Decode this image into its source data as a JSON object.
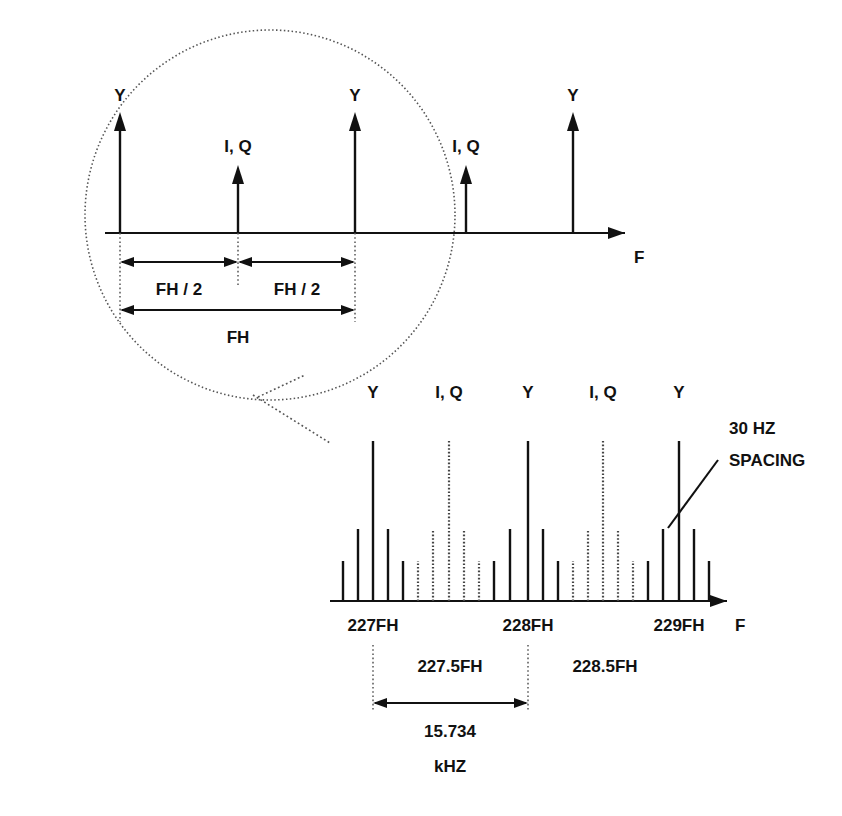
{
  "figure": {
    "axis_label": "F",
    "ink_color": "#111111",
    "dotted_color": "#555555"
  },
  "detail_view": {
    "name": "magnified-circle-view",
    "axis_label": "F",
    "spikes": [
      {
        "label": "Y",
        "x": 120,
        "height": 118,
        "style": "solid",
        "arrow": true
      },
      {
        "label": "I, Q",
        "x": 238,
        "height": 72,
        "style": "solid",
        "arrow": true
      },
      {
        "label": "Y",
        "x": 355,
        "height": 118,
        "style": "solid",
        "arrow": true
      },
      {
        "label": "I, Q",
        "x": 466,
        "height": 72,
        "style": "solid",
        "arrow": true
      },
      {
        "label": "Y",
        "x": 573,
        "height": 118,
        "style": "solid",
        "arrow": true
      }
    ],
    "dimensions": [
      {
        "label": "FH / 2",
        "from_x": 120,
        "to_x": 238,
        "y": 262
      },
      {
        "label": "FH / 2",
        "from_x": 238,
        "to_x": 355,
        "y": 262
      },
      {
        "label": "FH",
        "from_x": 120,
        "to_x": 355,
        "y": 310
      }
    ]
  },
  "spectrum_view": {
    "name": "sideband-spectrum",
    "axis_label": "F",
    "annotation": {
      "line1": "30 HZ",
      "line2": "SPACING"
    },
    "peak_labels": [
      {
        "text": "Y",
        "x": 373
      },
      {
        "text": "I, Q",
        "x": 449
      },
      {
        "text": "Y",
        "x": 528
      },
      {
        "text": "I, Q",
        "x": 603
      },
      {
        "text": "Y",
        "x": 679
      }
    ],
    "tick_labels": [
      {
        "text": "227FH",
        "x": 373
      },
      {
        "text": "228FH",
        "x": 528
      },
      {
        "text": "229FH",
        "x": 679
      }
    ],
    "band_labels": [
      {
        "text": "227.5FH",
        "x": 450
      },
      {
        "text": "228.5FH",
        "x": 605
      }
    ],
    "measurement": {
      "value": "15.734",
      "unit": "kHZ",
      "from_x": 373,
      "to_x": 528
    }
  },
  "chart_data": {
    "type": "bar",
    "xlabel": "F",
    "ylabel": "",
    "grid": false,
    "legend": [
      "Y (luminance, solid)",
      "I, Q (chrominance, dotted)"
    ],
    "note": "Harmonic clusters spaced at FH with 30 Hz sideband spacing; chroma interleaves at odd half-multiples of FH.",
    "annotations": [
      "30 HZ SPACING",
      "15.734 kHZ",
      "227.5FH",
      "228.5FH"
    ],
    "categories": [
      "227FH",
      "228FH",
      "229FH"
    ],
    "detail_categories": [
      "Y",
      "I, Q",
      "Y",
      "I, Q",
      "Y"
    ],
    "detail_values": [
      118,
      72,
      118,
      72,
      118
    ],
    "bars": [
      {
        "x": 343,
        "h": 40,
        "style": "solid"
      },
      {
        "x": 358,
        "h": 72,
        "style": "solid"
      },
      {
        "x": 373,
        "h": 160,
        "style": "solid"
      },
      {
        "x": 388,
        "h": 72,
        "style": "solid"
      },
      {
        "x": 403,
        "h": 40,
        "style": "solid"
      },
      {
        "x": 418,
        "h": 40,
        "style": "dotted"
      },
      {
        "x": 433,
        "h": 72,
        "style": "dotted"
      },
      {
        "x": 449,
        "h": 160,
        "style": "dotted"
      },
      {
        "x": 464,
        "h": 72,
        "style": "dotted"
      },
      {
        "x": 479,
        "h": 40,
        "style": "dotted"
      },
      {
        "x": 494,
        "h": 40,
        "style": "solid"
      },
      {
        "x": 510,
        "h": 72,
        "style": "solid"
      },
      {
        "x": 528,
        "h": 160,
        "style": "solid"
      },
      {
        "x": 543,
        "h": 72,
        "style": "solid"
      },
      {
        "x": 558,
        "h": 40,
        "style": "solid"
      },
      {
        "x": 573,
        "h": 40,
        "style": "dotted"
      },
      {
        "x": 588,
        "h": 72,
        "style": "dotted"
      },
      {
        "x": 603,
        "h": 160,
        "style": "dotted"
      },
      {
        "x": 618,
        "h": 72,
        "style": "dotted"
      },
      {
        "x": 633,
        "h": 40,
        "style": "dotted"
      },
      {
        "x": 648,
        "h": 40,
        "style": "solid"
      },
      {
        "x": 663,
        "h": 72,
        "style": "solid"
      },
      {
        "x": 679,
        "h": 160,
        "style": "solid"
      },
      {
        "x": 694,
        "h": 72,
        "style": "solid"
      },
      {
        "x": 709,
        "h": 40,
        "style": "solid"
      }
    ],
    "ylim": [
      0,
      170
    ],
    "baseline_y": 601
  }
}
